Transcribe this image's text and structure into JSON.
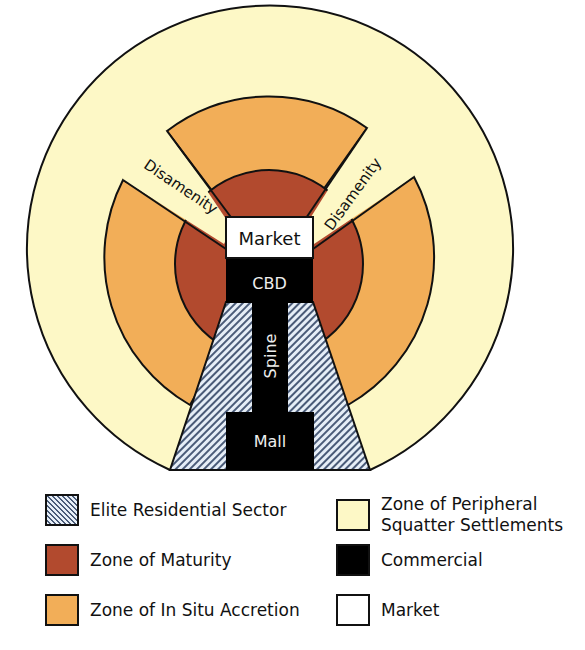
{
  "diagram": {
    "labels": {
      "market": "Market",
      "cbd": "CBD",
      "spine": "Spine",
      "mall": "Mall",
      "disamenity_left": "Disamenity",
      "disamenity_right": "Disamenity"
    }
  },
  "colors": {
    "peripheral": "#FDF8C6",
    "accretion": "#F2AE58",
    "maturity": "#B24A2E",
    "commercial": "#000000",
    "market": "#FFFFFF",
    "elite_stripe": "#4A5B78",
    "elite_bg": "#E6EEF7"
  },
  "legend": {
    "items": [
      {
        "label": "Elite Residential Sector",
        "key": "elite"
      },
      {
        "label": "Zone of Maturity",
        "key": "maturity"
      },
      {
        "label": "Zone of In Situ Accretion",
        "key": "accretion"
      },
      {
        "label": "Zone of Peripheral\nSquatter Settlements",
        "key": "peripheral"
      },
      {
        "label": "Commercial",
        "key": "commercial"
      },
      {
        "label": "Market",
        "key": "market"
      }
    ]
  }
}
